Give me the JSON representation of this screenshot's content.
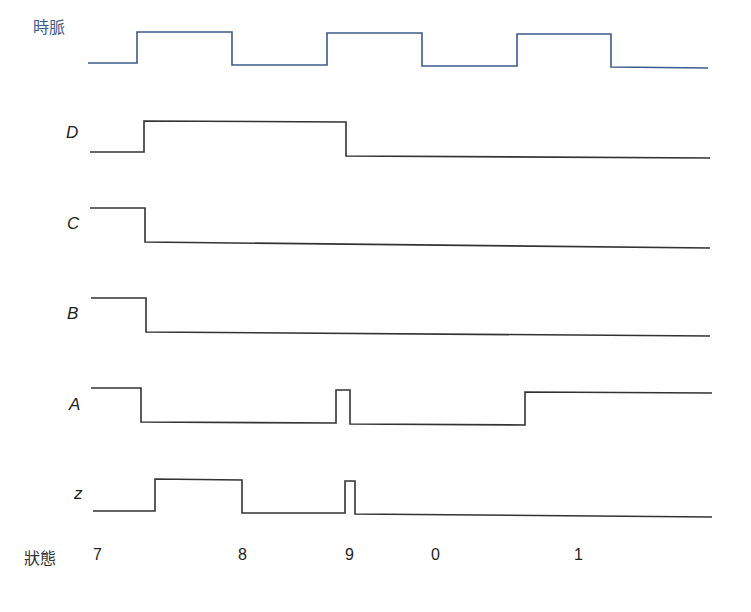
{
  "diagram": {
    "type": "timing-diagram",
    "colors": {
      "clock": "#3c5a8c",
      "signal": "#333333"
    },
    "signals": [
      {
        "name": "時脈",
        "id": "clock",
        "italic": false,
        "label_x": 33,
        "label_y": 20,
        "points": "88,63 137,63 137,32 232,32 232,65 327,65 327,33 422,33 422,66 517,66 517,34 611,34 611,67 708,68"
      },
      {
        "name": "D",
        "id": "D",
        "italic": true,
        "label_x": 66,
        "label_y": 125,
        "points": "90,152 144,152 144,121 346,122 346,156 710,158"
      },
      {
        "name": "C",
        "id": "C",
        "italic": true,
        "label_x": 67,
        "label_y": 216,
        "points": "90,208 145,208 145,242 710,248"
      },
      {
        "name": "B",
        "id": "B",
        "italic": true,
        "label_x": 67,
        "label_y": 306,
        "points": "91,298 146,298 146,332 710,336"
      },
      {
        "name": "A",
        "id": "A",
        "italic": true,
        "label_x": 69,
        "label_y": 397,
        "points": "91,388 141,388 141,422 336,423 336,390 350,390 350,424 525,425 525,392 712,393"
      },
      {
        "name": "z",
        "id": "z",
        "italic": true,
        "label_x": 74,
        "label_y": 486,
        "points": "93,511 155,511 155,479 242,480 242,513 345,513 345,481 355,481 355,514 712,517"
      }
    ],
    "state_row": {
      "title": "狀態",
      "values": [
        {
          "label": "7",
          "x": 93
        },
        {
          "label": "8",
          "x": 238
        },
        {
          "label": "9",
          "x": 345
        },
        {
          "label": "0",
          "x": 431
        },
        {
          "label": "1",
          "x": 574
        }
      ]
    }
  }
}
